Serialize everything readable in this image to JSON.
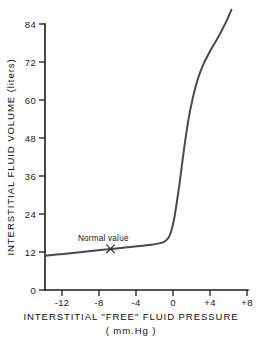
{
  "chart_data": {
    "type": "line",
    "title": "",
    "xlabel": "INTERSTITIAL \"FREE\" FLUID PRESSURE",
    "xlabel_units": "( mm.Hg )",
    "ylabel": "INTERSTITIAL FLUID VOLUME (liters)",
    "xlim": [
      -14,
      8
    ],
    "ylim": [
      0,
      90
    ],
    "grid": false,
    "legend": "none",
    "xticks": [
      -12,
      -8,
      -4,
      0,
      4,
      8
    ],
    "xtick_labels": [
      "-12",
      "-8",
      "-4",
      "0",
      "+4",
      "+8"
    ],
    "yticks": [
      0,
      12,
      24,
      36,
      48,
      60,
      72,
      84
    ],
    "ytick_labels": [
      "0",
      "12",
      "24",
      "36",
      "48",
      "60",
      "72",
      "84"
    ],
    "series": [
      {
        "name": "interstitial fluid volume",
        "color": "#4a4a4a",
        "x": [
          -14.0,
          -12.0,
          -10.0,
          -8.0,
          -6.0,
          -4.0,
          -2.5,
          -1.5,
          -1.0,
          -0.6,
          -0.3,
          0.0,
          0.3,
          0.6,
          1.0,
          1.5,
          2.0,
          2.6,
          3.2,
          4.0,
          4.8,
          5.6,
          6.2
        ],
        "y": [
          10.8,
          11.4,
          12.0,
          12.6,
          13.2,
          13.8,
          14.3,
          14.8,
          15.4,
          16.6,
          18.8,
          22.5,
          28.0,
          34.0,
          43.0,
          53.0,
          60.5,
          67.0,
          71.5,
          76.0,
          80.0,
          84.5,
          88.5
        ]
      }
    ],
    "annotations": [
      {
        "text": "Normal value",
        "marker": "x",
        "point_x": -6.9,
        "point_y": 13.0,
        "label_x": -5.2,
        "label_y": 20.5
      }
    ]
  }
}
